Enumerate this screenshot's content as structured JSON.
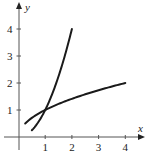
{
  "chart_data": {
    "type": "line",
    "title": "",
    "xlabel": "x",
    "ylabel": "y",
    "xlim": [
      -0.7,
      4.6
    ],
    "ylim": [
      -0.5,
      4.9
    ],
    "grid": false,
    "legend": null,
    "x_ticks": [
      "1",
      "2",
      "3",
      "4"
    ],
    "y_ticks": [
      "1",
      "2",
      "3",
      "4"
    ],
    "series": [
      {
        "name": "y = x^2",
        "x_range": [
          0.5,
          2
        ],
        "points": [
          [
            0.5,
            0.25
          ],
          [
            0.75,
            0.5625
          ],
          [
            1,
            1
          ],
          [
            1.25,
            1.5625
          ],
          [
            1.5,
            2.25
          ],
          [
            1.75,
            3.0625
          ],
          [
            2,
            4
          ]
        ]
      },
      {
        "name": "y = sqrt(x)",
        "x_range": [
          0.25,
          4
        ],
        "points": [
          [
            0.25,
            0.5
          ],
          [
            0.5,
            0.707
          ],
          [
            1,
            1
          ],
          [
            1.5,
            1.225
          ],
          [
            2,
            1.414
          ],
          [
            2.5,
            1.581
          ],
          [
            3,
            1.732
          ],
          [
            3.5,
            1.871
          ],
          [
            4,
            2
          ]
        ]
      }
    ],
    "annotations": []
  }
}
